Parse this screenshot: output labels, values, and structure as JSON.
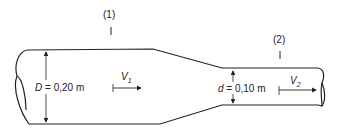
{
  "diagram": {
    "sections": [
      {
        "id": "section-1",
        "label": "(1)"
      },
      {
        "id": "section-2",
        "label": "(2)"
      }
    ],
    "large_pipe": {
      "diameter_symbol": "D",
      "diameter_value": "= 0,20 m",
      "velocity_symbol": "V",
      "velocity_subscript": "1"
    },
    "small_pipe": {
      "diameter_symbol": "d",
      "diameter_value": "= 0,10 m",
      "velocity_symbol": "V",
      "velocity_subscript": "2"
    },
    "colors": {
      "line": "#222222",
      "background": "#ffffff"
    }
  }
}
